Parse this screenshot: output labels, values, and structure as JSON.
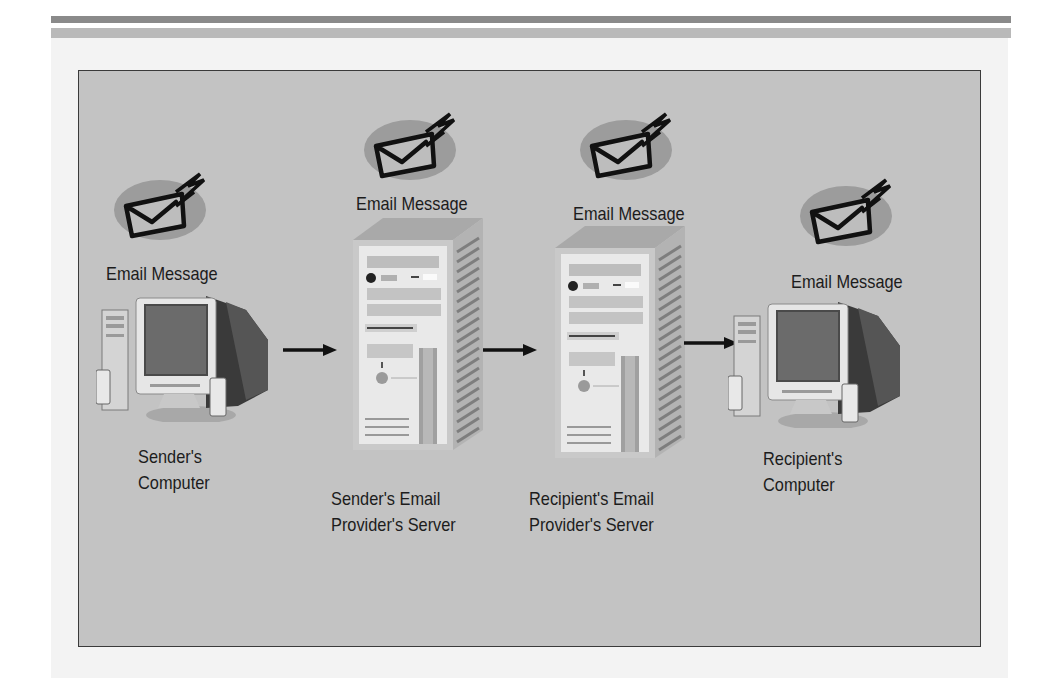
{
  "diagram": {
    "title": "",
    "background_color": "#c3c3c3",
    "nodes": [
      {
        "id": "sender-computer",
        "type": "computer",
        "message_label": "Email Message",
        "caption": "Sender's\nComputer"
      },
      {
        "id": "sender-server",
        "type": "server",
        "message_label": "Email Message",
        "caption": "Sender's Email\nProvider's Server"
      },
      {
        "id": "recipient-server",
        "type": "server",
        "message_label": "Email Message",
        "caption": "Recipient's Email\nProvider's Server"
      },
      {
        "id": "recipient-computer",
        "type": "computer",
        "message_label": "Email Message",
        "caption": "Recipient's\nComputer"
      }
    ],
    "edges": [
      {
        "from": "sender-computer",
        "to": "sender-server",
        "style": "arrow"
      },
      {
        "from": "sender-server",
        "to": "recipient-server",
        "style": "arrow"
      },
      {
        "from": "recipient-server",
        "to": "recipient-computer",
        "style": "arrow"
      }
    ],
    "icons": {
      "message": "envelope-with-lightning-icon",
      "computer": "desktop-computer-icon",
      "server": "server-tower-icon"
    }
  }
}
